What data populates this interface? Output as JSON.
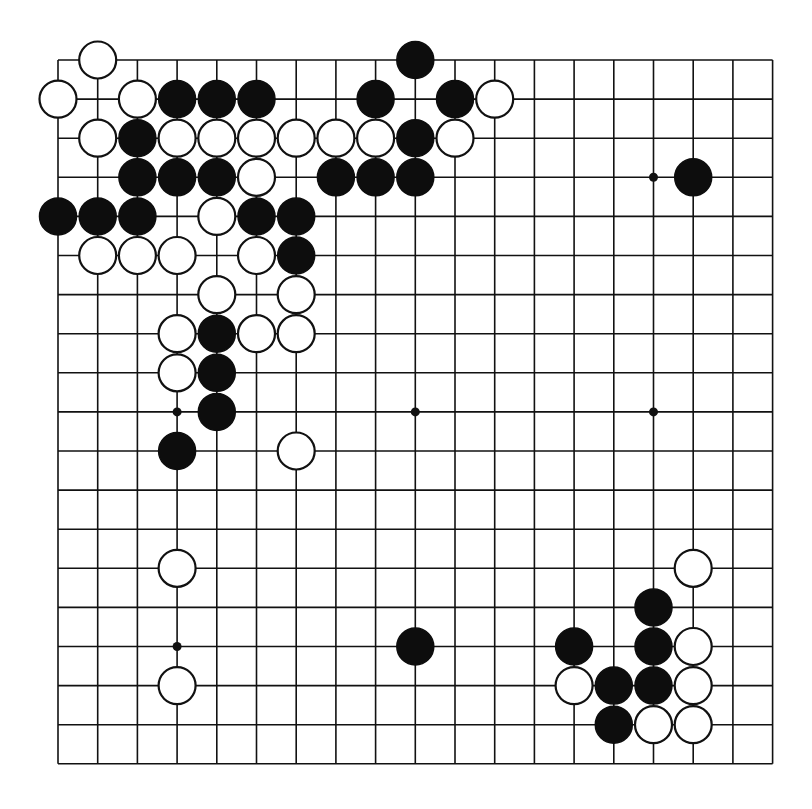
{
  "board": {
    "size": 19,
    "origin_x": 58,
    "origin_y": 60,
    "spacing_x": 39.7,
    "spacing_y": 39.1,
    "stone_radius": 18.5,
    "star_radius": 4.5,
    "colors": {
      "background": "#ffffff",
      "line": "#111111",
      "black_stone": "#0d0d0d",
      "white_stone": "#ffffff"
    },
    "star_points": [
      [
        3,
        3
      ],
      [
        9,
        3
      ],
      [
        15,
        3
      ],
      [
        3,
        9
      ],
      [
        9,
        9
      ],
      [
        15,
        9
      ],
      [
        3,
        15
      ],
      [
        9,
        15
      ],
      [
        15,
        15
      ]
    ],
    "stones": [
      {
        "color": "white",
        "col": 1,
        "row": 0
      },
      {
        "color": "black",
        "col": 9,
        "row": 0
      },
      {
        "color": "white",
        "col": 0,
        "row": 1
      },
      {
        "color": "white",
        "col": 2,
        "row": 1
      },
      {
        "color": "black",
        "col": 3,
        "row": 1
      },
      {
        "color": "black",
        "col": 4,
        "row": 1
      },
      {
        "color": "black",
        "col": 5,
        "row": 1
      },
      {
        "color": "black",
        "col": 8,
        "row": 1
      },
      {
        "color": "black",
        "col": 10,
        "row": 1
      },
      {
        "color": "white",
        "col": 11,
        "row": 1
      },
      {
        "color": "white",
        "col": 1,
        "row": 2
      },
      {
        "color": "black",
        "col": 2,
        "row": 2
      },
      {
        "color": "white",
        "col": 3,
        "row": 2
      },
      {
        "color": "white",
        "col": 4,
        "row": 2
      },
      {
        "color": "white",
        "col": 5,
        "row": 2
      },
      {
        "color": "white",
        "col": 6,
        "row": 2
      },
      {
        "color": "white",
        "col": 7,
        "row": 2
      },
      {
        "color": "white",
        "col": 8,
        "row": 2
      },
      {
        "color": "black",
        "col": 9,
        "row": 2
      },
      {
        "color": "white",
        "col": 10,
        "row": 2
      },
      {
        "color": "black",
        "col": 2,
        "row": 3
      },
      {
        "color": "black",
        "col": 3,
        "row": 3
      },
      {
        "color": "black",
        "col": 4,
        "row": 3
      },
      {
        "color": "white",
        "col": 5,
        "row": 3
      },
      {
        "color": "black",
        "col": 7,
        "row": 3
      },
      {
        "color": "black",
        "col": 8,
        "row": 3
      },
      {
        "color": "black",
        "col": 9,
        "row": 3
      },
      {
        "color": "black",
        "col": 16,
        "row": 3
      },
      {
        "color": "black",
        "col": 0,
        "row": 4
      },
      {
        "color": "black",
        "col": 1,
        "row": 4
      },
      {
        "color": "black",
        "col": 2,
        "row": 4
      },
      {
        "color": "white",
        "col": 4,
        "row": 4
      },
      {
        "color": "black",
        "col": 5,
        "row": 4
      },
      {
        "color": "black",
        "col": 6,
        "row": 4
      },
      {
        "color": "white",
        "col": 1,
        "row": 5
      },
      {
        "color": "white",
        "col": 2,
        "row": 5
      },
      {
        "color": "white",
        "col": 3,
        "row": 5
      },
      {
        "color": "white",
        "col": 5,
        "row": 5
      },
      {
        "color": "black",
        "col": 6,
        "row": 5
      },
      {
        "color": "white",
        "col": 4,
        "row": 6
      },
      {
        "color": "white",
        "col": 6,
        "row": 6
      },
      {
        "color": "white",
        "col": 3,
        "row": 7
      },
      {
        "color": "black",
        "col": 4,
        "row": 7
      },
      {
        "color": "white",
        "col": 5,
        "row": 7
      },
      {
        "color": "white",
        "col": 6,
        "row": 7
      },
      {
        "color": "white",
        "col": 3,
        "row": 8
      },
      {
        "color": "black",
        "col": 4,
        "row": 8
      },
      {
        "color": "black",
        "col": 4,
        "row": 9
      },
      {
        "color": "black",
        "col": 3,
        "row": 10
      },
      {
        "color": "white",
        "col": 6,
        "row": 10
      },
      {
        "color": "white",
        "col": 3,
        "row": 13
      },
      {
        "color": "white",
        "col": 16,
        "row": 13
      },
      {
        "color": "black",
        "col": 15,
        "row": 14
      },
      {
        "color": "black",
        "col": 9,
        "row": 15
      },
      {
        "color": "black",
        "col": 13,
        "row": 15
      },
      {
        "color": "black",
        "col": 15,
        "row": 15
      },
      {
        "color": "white",
        "col": 16,
        "row": 15
      },
      {
        "color": "white",
        "col": 3,
        "row": 16
      },
      {
        "color": "white",
        "col": 13,
        "row": 16
      },
      {
        "color": "black",
        "col": 14,
        "row": 16
      },
      {
        "color": "black",
        "col": 15,
        "row": 16
      },
      {
        "color": "white",
        "col": 16,
        "row": 16
      },
      {
        "color": "black",
        "col": 14,
        "row": 17
      },
      {
        "color": "white",
        "col": 15,
        "row": 17
      },
      {
        "color": "white",
        "col": 16,
        "row": 17
      }
    ]
  }
}
